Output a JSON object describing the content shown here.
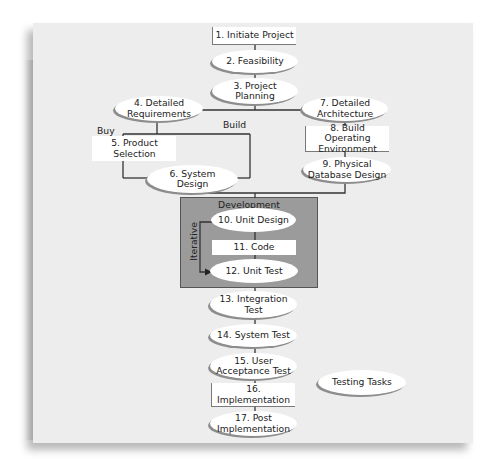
{
  "diagram": {
    "colors": {
      "panel": "#ededed",
      "node_fill": "#ffffff",
      "development_fill": "#9b9b9b",
      "line": "#333333"
    },
    "nodes": [
      {
        "id": 1,
        "label": "1. Initiate Project",
        "shape": "rect"
      },
      {
        "id": 2,
        "label": "2. Feasibility",
        "shape": "ellipse"
      },
      {
        "id": 3,
        "label": "3. Project\nPlanning",
        "shape": "ellipse"
      },
      {
        "id": 4,
        "label": "4. Detailed\nRequirements",
        "shape": "ellipse"
      },
      {
        "id": 5,
        "label": "5. Product\nSelection",
        "shape": "rect"
      },
      {
        "id": 6,
        "label": "6. System\nDesign",
        "shape": "ellipse"
      },
      {
        "id": 7,
        "label": "7. Detailed\nArchitecture",
        "shape": "ellipse"
      },
      {
        "id": 8,
        "label": "8. Build Operating\nEnvironment",
        "shape": "rect"
      },
      {
        "id": 9,
        "label": "9. Physical\nDatabase Design",
        "shape": "ellipse"
      },
      {
        "id": 10,
        "label": "10. Unit Design",
        "shape": "ellipse"
      },
      {
        "id": 11,
        "label": "11. Code",
        "shape": "rect"
      },
      {
        "id": 12,
        "label": "12. Unit Test",
        "shape": "ellipse"
      },
      {
        "id": 13,
        "label": "13. Integration\nTest",
        "shape": "ellipse"
      },
      {
        "id": 14,
        "label": "14. System Test",
        "shape": "ellipse"
      },
      {
        "id": 15,
        "label": "15. User\nAcceptance Test",
        "shape": "ellipse"
      },
      {
        "id": 16,
        "label": "16.\nImplementation",
        "shape": "rect"
      },
      {
        "id": 17,
        "label": "17. Post\nImplementation",
        "shape": "ellipse"
      }
    ],
    "labels": {
      "buy": "Buy",
      "build": "Build",
      "development": "Development",
      "iterative": "Iterative"
    },
    "legend": {
      "testing_tasks": "Testing Tasks"
    }
  }
}
